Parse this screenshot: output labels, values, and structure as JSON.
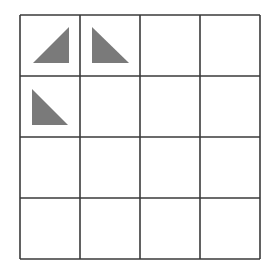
{
  "grid": {
    "rows": 4,
    "cols": 4,
    "left": 20,
    "top": 15,
    "cell_w": 60,
    "cell_h": 61,
    "line_color": "#3a3a3a",
    "line_width": 1.6
  },
  "triangles": [
    {
      "row": 0,
      "col": 0,
      "right_angle": "bottom-right",
      "points": [
        [
          33,
          63
        ],
        [
          69,
          63
        ],
        [
          69,
          27
        ]
      ],
      "fill": "#7a7a7a"
    },
    {
      "row": 0,
      "col": 1,
      "right_angle": "bottom-left",
      "points": [
        [
          92,
          27
        ],
        [
          92,
          63
        ],
        [
          129,
          63
        ]
      ],
      "fill": "#7a7a7a"
    },
    {
      "row": 1,
      "col": 0,
      "right_angle": "bottom-left",
      "points": [
        [
          32,
          89
        ],
        [
          32,
          125
        ],
        [
          68,
          125
        ]
      ],
      "fill": "#7a7a7a"
    }
  ]
}
